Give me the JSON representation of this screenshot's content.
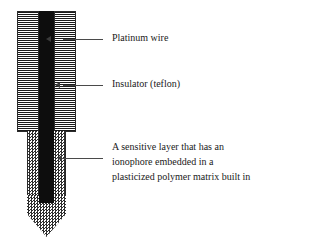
{
  "diagram": {
    "components": [
      {
        "id": "platinum-wire",
        "label": "Platinum wire",
        "color": "#0d0d0d",
        "fill": "solid-black"
      },
      {
        "id": "insulator",
        "label": "Insulator (teflon)",
        "color": "#1a1a1a",
        "fill": "horizontal-hatch"
      },
      {
        "id": "sensitive-layer",
        "label_lines": [
          "A sensitive layer that has an",
          "ionophore embedded in a",
          "plasticized polymer matrix built in"
        ],
        "color": "#2e2e2e",
        "fill": "checkerboard"
      }
    ],
    "background_color": "#ffffff"
  }
}
